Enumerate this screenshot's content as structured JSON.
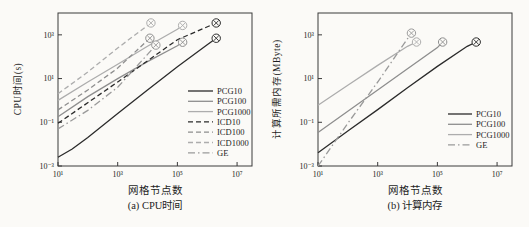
{
  "figure": {
    "background": "#fbfaf7",
    "frame_color": "#3a3a3a",
    "marker_glyph": "circled-x",
    "panel_count": 2
  },
  "chart_data": [
    {
      "type": "line",
      "title": "(a) CPU时间",
      "xlabel": "网格节点数",
      "ylabel": "CPU时间(s)",
      "xscale": "log",
      "yscale": "log",
      "xlim": [
        10,
        31622777
      ],
      "ylim": [
        0.001,
        10000
      ],
      "xticks": [
        {
          "v": 10,
          "label": "10¹"
        },
        {
          "v": 1000,
          "label": "10³"
        },
        {
          "v": 100000,
          "label": "10⁵"
        },
        {
          "v": 10000000,
          "label": "10⁷"
        }
      ],
      "yticks": [
        {
          "v": 0.001,
          "label": "10⁻³"
        },
        {
          "v": 0.1,
          "label": "10⁻¹"
        },
        {
          "v": 10,
          "label": "10¹"
        },
        {
          "v": 1000,
          "label": "10³"
        }
      ],
      "grid": false,
      "legend_position": "inside-right",
      "series": [
        {
          "name": "PCG10",
          "color": "#2b2b2b",
          "dash": "solid",
          "end_marker": true,
          "points": [
            [
              10,
              0.0025
            ],
            [
              30,
              0.006
            ],
            [
              100,
              0.02
            ],
            [
              1000,
              0.25
            ],
            [
              10000,
              3
            ],
            [
              100000,
              35
            ],
            [
              1000000,
              350
            ],
            [
              2000000,
              700
            ]
          ]
        },
        {
          "name": "PCG100",
          "color": "#8e8e8e",
          "dash": "solid",
          "end_marker": true,
          "points": [
            [
              10,
              0.18
            ],
            [
              100,
              1.5
            ],
            [
              1000,
              10
            ],
            [
              10000,
              60
            ],
            [
              100000,
              320
            ],
            [
              150000,
              460
            ]
          ]
        },
        {
          "name": "PCG1000",
          "color": "#adadad",
          "dash": "solid",
          "end_marker": true,
          "points": [
            [
              10,
              1
            ],
            [
              100,
              7
            ],
            [
              1000,
              45
            ],
            [
              10000,
              300
            ],
            [
              100000,
              1800
            ],
            [
              150000,
              2700
            ]
          ]
        },
        {
          "name": "ICD10",
          "color": "#2b2b2b",
          "dash": "dashed",
          "end_marker": true,
          "points": [
            [
              10,
              0.09
            ],
            [
              1000,
              7
            ],
            [
              100000,
              600
            ],
            [
              2000000,
              3500
            ]
          ]
        },
        {
          "name": "ICD100",
          "color": "#8e8e8e",
          "dash": "dashed",
          "end_marker": true,
          "points": [
            [
              10,
              0.37
            ],
            [
              100,
              3
            ],
            [
              1000,
              30
            ],
            [
              12000,
              700
            ]
          ]
        },
        {
          "name": "ICD1000",
          "color": "#adadad",
          "dash": "dashed",
          "end_marker": true,
          "points": [
            [
              10,
              2
            ],
            [
              100,
              20
            ],
            [
              1000,
              250
            ],
            [
              13000,
              3500
            ]
          ]
        },
        {
          "name": "GE",
          "color": "#9a9a9a",
          "dash": "dashdot",
          "end_marker": true,
          "points": [
            [
              10,
              0.05
            ],
            [
              100,
              0.35
            ],
            [
              1000,
              4
            ],
            [
              5000,
              45
            ],
            [
              19000,
              340
            ]
          ]
        }
      ]
    },
    {
      "type": "line",
      "title": "(b) 计算内存",
      "xlabel": "网格节点数",
      "ylabel": "计算所需内存(MByte)",
      "xscale": "log",
      "yscale": "log",
      "xlim": [
        10,
        31622777
      ],
      "ylim": [
        0.001,
        10000
      ],
      "xticks": [
        {
          "v": 10,
          "label": "10¹"
        },
        {
          "v": 1000,
          "label": "10³"
        },
        {
          "v": 100000,
          "label": "10⁵"
        },
        {
          "v": 10000000,
          "label": "10⁷"
        }
      ],
      "yticks": [
        {
          "v": 0.001,
          "label": "10⁻³"
        },
        {
          "v": 0.1,
          "label": "10⁻¹"
        },
        {
          "v": 10,
          "label": "10¹"
        },
        {
          "v": 1000,
          "label": "10³"
        }
      ],
      "grid": false,
      "legend_position": "inside-right",
      "series": [
        {
          "name": "PCG10",
          "color": "#2b2b2b",
          "dash": "solid",
          "end_marker": true,
          "points": [
            [
              10,
              0.004
            ],
            [
              100,
              0.04
            ],
            [
              1000,
              0.38
            ],
            [
              10000,
              3.8
            ],
            [
              100000,
              36
            ],
            [
              1000000,
              300
            ],
            [
              2000000,
              470
            ]
          ]
        },
        {
          "name": "PCG100",
          "color": "#8e8e8e",
          "dash": "solid",
          "end_marker": true,
          "points": [
            [
              10,
              0.034
            ],
            [
              100,
              0.32
            ],
            [
              1000,
              3
            ],
            [
              10000,
              28
            ],
            [
              100000,
              260
            ],
            [
              150000,
              470
            ]
          ]
        },
        {
          "name": "PCG1000",
          "color": "#adadad",
          "dash": "solid",
          "end_marker": true,
          "points": [
            [
              10,
              0.6
            ],
            [
              100,
              5
            ],
            [
              1000,
              40
            ],
            [
              10000,
              300
            ],
            [
              20000,
              470
            ]
          ]
        },
        {
          "name": "GE",
          "color": "#9a9a9a",
          "dash": "dashdot",
          "end_marker": true,
          "points": [
            [
              10,
              0.001
            ],
            [
              100,
              0.09
            ],
            [
              1000,
              7
            ],
            [
              13500,
              1200
            ]
          ]
        }
      ]
    }
  ]
}
